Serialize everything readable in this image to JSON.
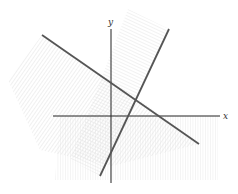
{
  "diagram": {
    "type": "system-of-linear-inequalities-graph",
    "axes": {
      "x_label": "x",
      "y_label": "y",
      "origin_px": [
        111,
        116
      ],
      "x_axis_px": [
        53,
        220
      ],
      "y_axis_px": [
        29,
        183
      ]
    },
    "lines": [
      {
        "name": "line-decreasing",
        "from_px": [
          42,
          35
        ],
        "to_px": [
          199,
          144
        ],
        "color": "#555555"
      },
      {
        "name": "line-increasing",
        "from_px": [
          169,
          29
        ],
        "to_px": [
          100,
          176
        ],
        "color": "#555555"
      }
    ],
    "shaded_regions": [
      {
        "name": "below-decreasing-line",
        "hatch": "diagonal"
      },
      {
        "name": "left-of-increasing-line",
        "hatch": "diagonal-band"
      },
      {
        "name": "below-x-axis",
        "hatch": "vertical"
      }
    ],
    "colors": {
      "axis": "#222222",
      "line": "#555555",
      "hatch": "#d8d8d8"
    }
  }
}
